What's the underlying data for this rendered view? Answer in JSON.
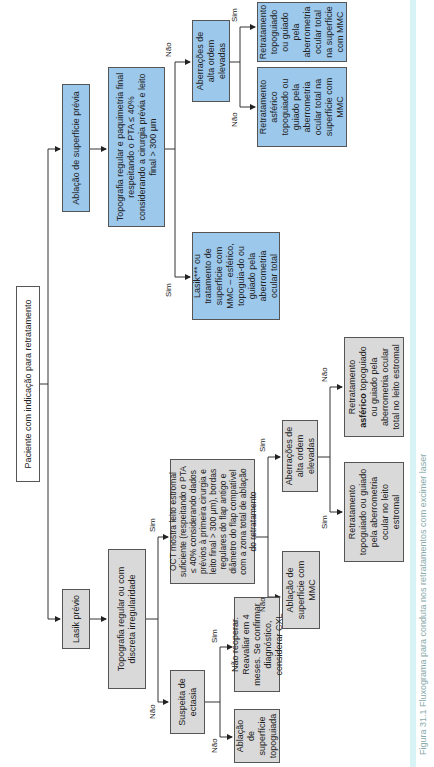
{
  "diagram": {
    "orientation": "rotated-90-ccw",
    "root": "Paciente com indicação para retratamento",
    "colors": {
      "blue_branch": "#9cc8ec",
      "gray_branch": "#d9d9d9",
      "line": "#333333"
    },
    "labels": {
      "yes": "Sim",
      "no": "Não"
    },
    "surface_branch": {
      "title": "Ablação de superfície prévia",
      "condition": "Topografia regular e paquimetria final respeitando o PTA ≤ 40% considerando a cirurgia prévia e leito final > 300 µm",
      "yes_result": "Lasik*** ou tratamento de superfície com MMC – esférico, topoguia-do ou guiado pela aberrometria ocular total",
      "no_condition": "Aberrações de alta ordem elevadas",
      "no_yes_result": "Retratamento topoguiado ou guiado pela aberrometria ocular total na superfície com MMC",
      "no_no_result": "Retratamento asférico topoguiado ou guiado pela aberrometria ocular total na superfície com MMC"
    },
    "lasik_branch": {
      "title": "Lasik prévio",
      "condition": "Topografia regular ou com discreta irregularidade",
      "yes_condition": "OCT mostra leito estromal suficiente (respeitando o PTA ≤ 40% considerando dados prévios à primeira cirurgia e leito final > 300 µm), bordas regulares do flap antigo e diâmetro do flap compatível com a zona total de ablação do retratamento",
      "yes_no_result": "Ablação de superfície com MMC",
      "yes_yes_condition": "Aberrações de alta ordem elevadas",
      "yes_yes_yes_result": "Retratamento topoguiado ou guiado pela aberrometria ocular no leito estromal",
      "yes_yes_no_result_prefix": "Retratamento ",
      "yes_yes_no_result_bold": "asférico",
      "yes_yes_no_result_suffix": " topoguiado ou guiado pela aberrometria ocular total no leito estromal",
      "no_condition": "Suspeita de ectasia",
      "no_yes_result": "Não reoperar. Reavaliar em 4 meses. Se confirmar diagnóstico, considerar CXL",
      "no_no_result": "Ablação de superfície topoguiada"
    },
    "caption": "Figura 31.1 Fluxograma para conduta nos retratamentos com excimer laser"
  }
}
